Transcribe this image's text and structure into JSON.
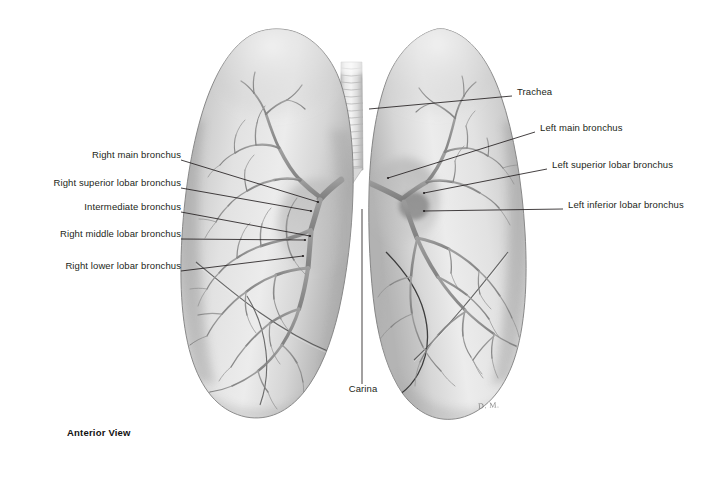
{
  "figure": {
    "view_caption": "Anterior View",
    "artist_signature": "D. M.",
    "background_color": "#ffffff",
    "line_color": "#231f20",
    "text_color": "#231f20"
  },
  "labels_left": [
    {
      "id": "right-main-bronchus",
      "text": "Right main bronchus",
      "text_x": 175,
      "text_y": 155,
      "leader": [
        [
          181,
          160
        ],
        [
          318,
          202
        ]
      ]
    },
    {
      "id": "right-superior-lobar-bronchus",
      "text": "Right superior lobar bronchus",
      "text_x": 175,
      "text_y": 183,
      "leader": [
        [
          181,
          188
        ],
        [
          311,
          211
        ]
      ]
    },
    {
      "id": "intermediate-bronchus",
      "text": "Intermediate bronchus",
      "text_x": 175,
      "text_y": 207,
      "leader": [
        [
          181,
          212
        ],
        [
          310,
          236
        ]
      ]
    },
    {
      "id": "right-middle-lobar-bronchus",
      "text": "Right middle lobar bronchus",
      "text_x": 175,
      "text_y": 234,
      "leader": [
        [
          181,
          239
        ],
        [
          305,
          240
        ]
      ]
    },
    {
      "id": "right-lower-lobar-bronchus",
      "text": "Right  lower lobar bronchus",
      "text_x": 175,
      "text_y": 266,
      "leader": [
        [
          181,
          271
        ],
        [
          303,
          256
        ]
      ]
    }
  ],
  "labels_right": [
    {
      "id": "trachea",
      "text": "Trachea",
      "text_x": 517,
      "text_y": 92,
      "leader": [
        [
          512,
          96
        ],
        [
          369,
          109
        ]
      ]
    },
    {
      "id": "left-main-bronchus",
      "text": "Left main bronchus",
      "text_x": 540,
      "text_y": 128,
      "leader": [
        [
          535,
          132
        ],
        [
          388,
          178
        ]
      ]
    },
    {
      "id": "left-superior-lobar-bronchus",
      "text": "Left superior lobar bronchus",
      "text_x": 552,
      "text_y": 165,
      "leader": [
        [
          547,
          169
        ],
        [
          424,
          193
        ]
      ]
    },
    {
      "id": "left-inferior-lobar-bronchus",
      "text": "Left inferior lobar bronchus",
      "text_x": 568,
      "text_y": 205,
      "leader": [
        [
          563,
          209
        ],
        [
          424,
          211
        ]
      ]
    }
  ],
  "labels_bottom": [
    {
      "id": "carina",
      "text": "Carina",
      "text_x": 366,
      "text_y": 389,
      "leader": [
        [
          362,
          384
        ],
        [
          362,
          209
        ]
      ]
    }
  ],
  "view_caption_pos": {
    "x": 67,
    "y": 427
  },
  "signature_pos": {
    "x": 478,
    "y": 401
  },
  "anatomy": {
    "trachea": {
      "label": "Trachea",
      "ring_count": 16,
      "x": 340,
      "y": 64,
      "width": 22,
      "height": 112
    },
    "right_lung": {
      "label": "Right lung (viewer left)",
      "lobes": [
        "superior",
        "middle",
        "inferior"
      ]
    },
    "left_lung": {
      "label": "Left lung (viewer right)",
      "lobes": [
        "superior",
        "inferior"
      ],
      "feature": "cardiac notch"
    }
  }
}
